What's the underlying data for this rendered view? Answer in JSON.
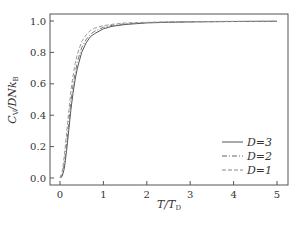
{
  "chart_data": {
    "type": "line",
    "title": "",
    "xlabel": "T/T_D",
    "ylabel": "C_V/DNk_B",
    "xlim": [
      -0.2,
      5.2
    ],
    "ylim": [
      -0.05,
      1.05
    ],
    "xticks": [
      "0",
      "1",
      "2",
      "3",
      "4",
      "5"
    ],
    "yticks": [
      "0.0",
      "0.2",
      "0.4",
      "0.6",
      "0.8",
      "1.0"
    ],
    "grid": false,
    "legend_position": "lower right",
    "x": [
      0,
      0.05,
      0.1,
      0.15,
      0.2,
      0.25,
      0.3,
      0.35,
      0.4,
      0.5,
      0.6,
      0.7,
      0.8,
      1.0,
      1.2,
      1.5,
      2.0,
      2.5,
      3.0,
      4.0,
      5.0
    ],
    "series": [
      {
        "name": "D=3",
        "style": "solid",
        "values": [
          0.0,
          0.01,
          0.06,
          0.17,
          0.3,
          0.43,
          0.54,
          0.63,
          0.7,
          0.8,
          0.86,
          0.9,
          0.92,
          0.95,
          0.966,
          0.978,
          0.988,
          0.992,
          0.994,
          0.997,
          0.998
        ]
      },
      {
        "name": "D=2",
        "style": "dashdot",
        "values": [
          0.0,
          0.02,
          0.09,
          0.21,
          0.35,
          0.48,
          0.59,
          0.67,
          0.74,
          0.83,
          0.88,
          0.915,
          0.935,
          0.96,
          0.972,
          0.982,
          0.99,
          0.993,
          0.995,
          0.997,
          0.998
        ]
      },
      {
        "name": "D=1",
        "style": "dashed",
        "values": [
          0.0,
          0.04,
          0.14,
          0.28,
          0.42,
          0.55,
          0.65,
          0.73,
          0.79,
          0.87,
          0.91,
          0.94,
          0.955,
          0.97,
          0.979,
          0.987,
          0.992,
          0.995,
          0.996,
          0.998,
          0.999
        ]
      }
    ]
  },
  "legend": {
    "items": [
      {
        "label": "D=3"
      },
      {
        "label": "D=2"
      },
      {
        "label": "D=1"
      }
    ]
  },
  "axes": {
    "xlabel_main": "T/T",
    "xlabel_sub": "D",
    "ylabel_main": "C",
    "ylabel_sub": "V",
    "ylabel_rest": "/DNk",
    "ylabel_sub2": "B"
  },
  "colors": {
    "axis": "#555555",
    "line": "#666666"
  }
}
